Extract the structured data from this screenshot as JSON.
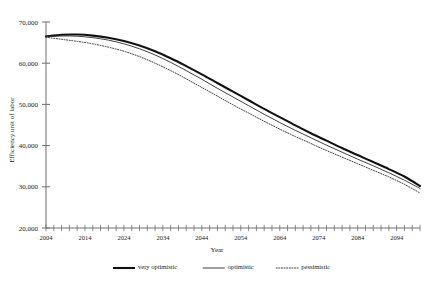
{
  "chart_data": {
    "type": "line",
    "title": "",
    "xlabel": "Year",
    "ylabel": "Efficiency unit of labor",
    "xlim": [
      2004,
      2100
    ],
    "ylim": [
      20000,
      70000
    ],
    "yticks": [
      20000,
      30000,
      40000,
      50000,
      60000,
      70000
    ],
    "ytick_labels": [
      "20,000",
      "30,000",
      "40,000",
      "50,000",
      "60,000",
      "70,000"
    ],
    "xticks": [
      2004,
      2014,
      2024,
      2034,
      2044,
      2054,
      2064,
      2074,
      2084,
      2094
    ],
    "xtick_labels": [
      "2004",
      "2014",
      "2024",
      "2034",
      "2044",
      "2054",
      "2064",
      "2074",
      "2084",
      "2094"
    ],
    "xtick_minor_step": 2,
    "grid": false,
    "legend_position": "bottom",
    "x": [
      2004,
      2008,
      2012,
      2016,
      2020,
      2024,
      2028,
      2032,
      2036,
      2040,
      2044,
      2048,
      2052,
      2056,
      2060,
      2064,
      2068,
      2072,
      2076,
      2080,
      2084,
      2088,
      2092,
      2096,
      2100
    ],
    "series": [
      {
        "name": "very optimistic",
        "style": "solid-thick",
        "color": "#111111",
        "width": 2.1,
        "values": [
          66500,
          66900,
          66950,
          66700,
          66200,
          65400,
          64300,
          62900,
          61200,
          59300,
          57300,
          55200,
          53100,
          51000,
          48900,
          46900,
          44900,
          43000,
          41200,
          39400,
          37700,
          36000,
          34300,
          32500,
          30200
        ]
      },
      {
        "name": "optimistic",
        "style": "solid-thin",
        "color": "#2b2b2b",
        "width": 0.9,
        "values": [
          66400,
          66600,
          66550,
          66200,
          65600,
          64700,
          63500,
          62000,
          60200,
          58200,
          56100,
          53900,
          51800,
          49700,
          47600,
          45600,
          43700,
          41900,
          40100,
          38400,
          36700,
          35100,
          33400,
          31600,
          29600
        ]
      },
      {
        "name": "pessimistic",
        "style": "dotted",
        "color": "#3a3a3a",
        "width": 1.0,
        "values": [
          66300,
          65800,
          65300,
          64700,
          63900,
          62900,
          61600,
          60000,
          58200,
          56200,
          54100,
          52000,
          49900,
          47900,
          45900,
          44000,
          42200,
          40500,
          38800,
          37200,
          35600,
          34000,
          32400,
          30600,
          28500
        ]
      }
    ],
    "legend": [
      {
        "label": "very optimistic",
        "style": "solid-thick"
      },
      {
        "label": "optimistic",
        "style": "solid-thin"
      },
      {
        "label": "pessimistic",
        "style": "dotted"
      }
    ]
  }
}
